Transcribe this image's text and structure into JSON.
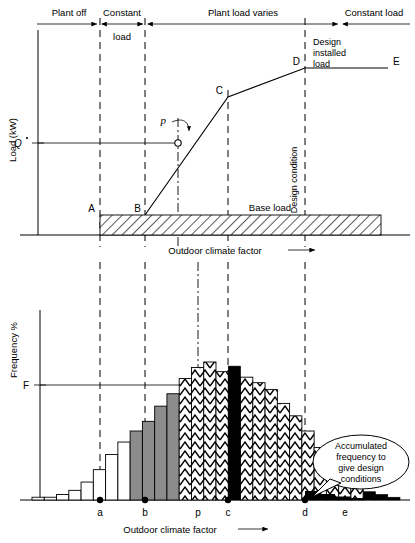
{
  "figure": {
    "title_top_bands": [
      {
        "id": "plant-off",
        "label": "Plant off",
        "x_start": 38,
        "x_end": 100
      },
      {
        "id": "constant-load",
        "label": "Constant",
        "label2": "load",
        "x_start": 100,
        "x_end": 145
      },
      {
        "id": "plant-load-varies",
        "label": "Plant load varies",
        "x_start": 145,
        "x_end": 340
      },
      {
        "id": "constant-load-right",
        "label": "Constant load",
        "x_start": 340,
        "x_end": 410
      }
    ],
    "top_chart": {
      "y_axis_label": "Load (kW)",
      "y_tick_label": "Q",
      "y_tick_dot": "˙",
      "x_axis_label": "Outdoor climate factor",
      "base_load_label": "Base load",
      "design_condition_label": "Design condition",
      "design_installed_load_label": "Design installed load",
      "design_installed_load_lines": [
        "Design",
        "installed",
        "load"
      ],
      "point_marker_label": "p",
      "points": [
        {
          "name": "A",
          "x": 100,
          "y": 215
        },
        {
          "name": "B",
          "x": 145,
          "y": 215
        },
        {
          "name": "C",
          "x": 228,
          "y": 97
        },
        {
          "name": "D",
          "x": 305,
          "y": 68
        },
        {
          "name": "E",
          "x": 388,
          "y": 68
        }
      ],
      "p_point": {
        "x": 178,
        "y": 143,
        "label": "p"
      },
      "q_line_y": 143,
      "base_load_band": {
        "x_start": 100,
        "x_end": 381,
        "y_top": 215,
        "y_bottom": 235
      }
    },
    "bottom_chart": {
      "y_axis_label": "Frequency %",
      "y_tick_label": "F",
      "x_axis_label": "Outdoor climate factor",
      "x_tick_labels": [
        "a",
        "b",
        "p",
        "c",
        "d",
        "e"
      ],
      "x_tick_positions": [
        100,
        145,
        198,
        228,
        305,
        345
      ],
      "marked_ticks": [
        "a",
        "b",
        "c",
        "d"
      ],
      "callout_text": "Accumulated frequency to give design conditions",
      "callout_lines": [
        "Accumulated",
        "frequency to",
        "give design",
        "conditions"
      ],
      "f_line_y": 385
    },
    "legend_patterns": {
      "empty": "white / unfilled bars below a",
      "grey": "solid grey bars between a and b",
      "chevron": "chevron hatched bars between b and d",
      "black": "solid black bar at p and accumulated tail beyond d",
      "hatch": "diagonal hatch for base load band"
    },
    "colors": {
      "line": "#000000",
      "grey_fill": "#8c8c8c",
      "black_fill": "#000000",
      "white_fill": "#ffffff",
      "background": "#ffffff"
    }
  },
  "chart_data": {
    "type": "bar",
    "title": "",
    "subtitle": "",
    "xlabel": "Outdoor climate factor",
    "ylabel": "Frequency %",
    "grid": false,
    "legend_position": "none",
    "xlim": [
      32,
      400
    ],
    "ylim": [
      0,
      100
    ],
    "tick_labels": [
      "a",
      "b",
      "p",
      "c",
      "d",
      "e"
    ],
    "tick_x": [
      100,
      145,
      198,
      228,
      305,
      345
    ],
    "categories": [
      "1",
      "2",
      "3",
      "4",
      "5",
      "6",
      "7",
      "8",
      "9",
      "10",
      "11",
      "12",
      "13",
      "14",
      "15",
      "16",
      "17",
      "18",
      "19",
      "20",
      "21",
      "22",
      "23",
      "24",
      "25",
      "26",
      "27",
      "28",
      "29",
      "30"
    ],
    "values": [
      2,
      2,
      4,
      7,
      13,
      22,
      33,
      42,
      50,
      57,
      68,
      77,
      88,
      96,
      100,
      93,
      97,
      89,
      85,
      80,
      70,
      61,
      50,
      38,
      27,
      17,
      10,
      6,
      4,
      2
    ],
    "bar_fill": [
      "empty",
      "empty",
      "empty",
      "empty",
      "empty",
      "empty",
      "empty",
      "empty",
      "grey",
      "grey",
      "grey",
      "grey",
      "chevron",
      "chevron",
      "chevron",
      "chevron",
      "black",
      "chevron",
      "chevron",
      "chevron",
      "chevron",
      "chevron",
      "chevron",
      "chevron",
      "chevron",
      "chevron",
      "chevron",
      "black",
      "black",
      "black"
    ],
    "series": [
      {
        "name": "Frequency distribution of outdoor climate factor",
        "values": [
          2,
          2,
          4,
          7,
          13,
          22,
          33,
          42,
          50,
          57,
          68,
          77,
          88,
          96,
          100,
          93,
          97,
          89,
          85,
          80,
          70,
          61,
          50,
          38,
          27,
          17,
          10,
          6,
          4,
          2
        ]
      }
    ],
    "annotations": [
      {
        "text": "F",
        "type": "y-reference-line",
        "y_value": 68
      },
      {
        "text": "Accumulated frequency to give design conditions",
        "type": "callout",
        "x_value": 345,
        "y_value": 8
      }
    ],
    "secondary_chart": {
      "type": "line",
      "ylabel": "Load (kW)",
      "xlabel": "Outdoor climate factor",
      "x": [
        100,
        145,
        178,
        228,
        305,
        388
      ],
      "y_labels": [
        "A",
        "B",
        "p",
        "C",
        "D",
        "E"
      ],
      "y": [
        0,
        0,
        52,
        86,
        97,
        97
      ],
      "reference_line": {
        "label": "Q",
        "y": 52
      },
      "base_load_label": "Base load"
    }
  }
}
